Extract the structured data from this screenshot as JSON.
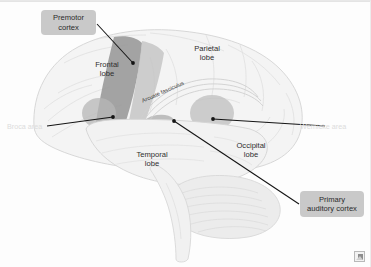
{
  "figure": {
    "kind": "anatomical-diagram",
    "background_color": "#fdfdfd",
    "callout_fill": "#c9c9c9",
    "leader_color": "#1a1a1a"
  },
  "callouts": [
    {
      "id": "premotor-cortex",
      "line1": "Premotor",
      "line2": "cortex",
      "text": "Premotor cortex"
    },
    {
      "id": "primary-auditory-cortex",
      "line1": "Primary",
      "line2": "auditory cortex",
      "text": "Primary auditory cortex"
    }
  ],
  "lobes": [
    {
      "id": "frontal",
      "label": "Frontal\nlobe"
    },
    {
      "id": "parietal",
      "label": "Parietal\nlobe"
    },
    {
      "id": "temporal",
      "label": "Temporal\nlobe"
    },
    {
      "id": "occipital",
      "label": "Occipital\nlobe"
    }
  ],
  "language_areas": [
    {
      "id": "broca",
      "label": "Broca area",
      "color": "#dcdcdc"
    },
    {
      "id": "wernicke",
      "label": "Wernicke area",
      "color": "#dcdcdc"
    }
  ],
  "tracts": [
    {
      "id": "arcuate-fasciculus",
      "label": "Arcuate fasciculus"
    }
  ],
  "regions": {
    "premotor_strip_color": "#9a9a9a",
    "secondary_strip_color": "#bdbdbd",
    "broca_patch_color": "#b4b4b4",
    "wernicke_patch_color": "#bdbdbd",
    "auditory_patch_color": "#a8a8a8",
    "cortex_fill": "#f3f3f3",
    "cortex_outline": "#d6d6d6",
    "cerebellum_fill": "#ededed",
    "brainstem_fill": "#f0f0f0"
  },
  "corner": {
    "icon": "broken-image-icon"
  }
}
